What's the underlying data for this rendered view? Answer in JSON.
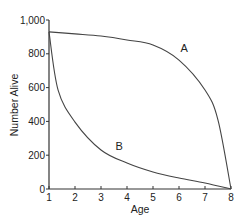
{
  "chart_data": {
    "type": "line",
    "title": "",
    "xlabel": "Age",
    "ylabel": "Number Alive",
    "xlim": [
      1,
      8
    ],
    "ylim": [
      0,
      1000
    ],
    "x_ticks": [
      "1",
      "2",
      "3",
      "4",
      "5",
      "6",
      "7",
      "8"
    ],
    "y_ticks": [
      "0",
      "200",
      "400",
      "600",
      "800",
      "1,000"
    ],
    "grid": false,
    "legend": "none (curves labeled directly)",
    "series": [
      {
        "name": "A",
        "x": [
          1,
          2,
          3,
          4,
          5,
          6,
          7,
          7.5,
          8
        ],
        "values": [
          930,
          918,
          905,
          882,
          852,
          763,
          586,
          408,
          0
        ]
      },
      {
        "name": "B",
        "x": [
          1,
          1.35,
          2,
          3,
          4,
          5,
          6,
          7,
          8
        ],
        "values": [
          930,
          585,
          396,
          231,
          154,
          101,
          65,
          36,
          0
        ]
      }
    ],
    "annotations": [
      {
        "text": "A",
        "x": 6.2,
        "y": 810
      },
      {
        "text": "B",
        "x": 3.7,
        "y": 230
      }
    ]
  }
}
